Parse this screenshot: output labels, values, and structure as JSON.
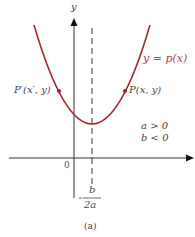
{
  "figure": {
    "caption": "(a)",
    "curve_label": "y = p(x)",
    "axis_y_label": "y",
    "origin_label": "0",
    "point_right_label": "P(x, y)",
    "point_left_label": "P′(x′, y)",
    "condition_a": "a > 0",
    "condition_b": "b < 0",
    "vertex_numerator": "b",
    "vertex_minus": "−",
    "vertex_denominator": "2a",
    "colors": {
      "curve": "#a3262e",
      "curve_label": "#b5414a",
      "axis": "#333333",
      "text": "#444444"
    }
  }
}
